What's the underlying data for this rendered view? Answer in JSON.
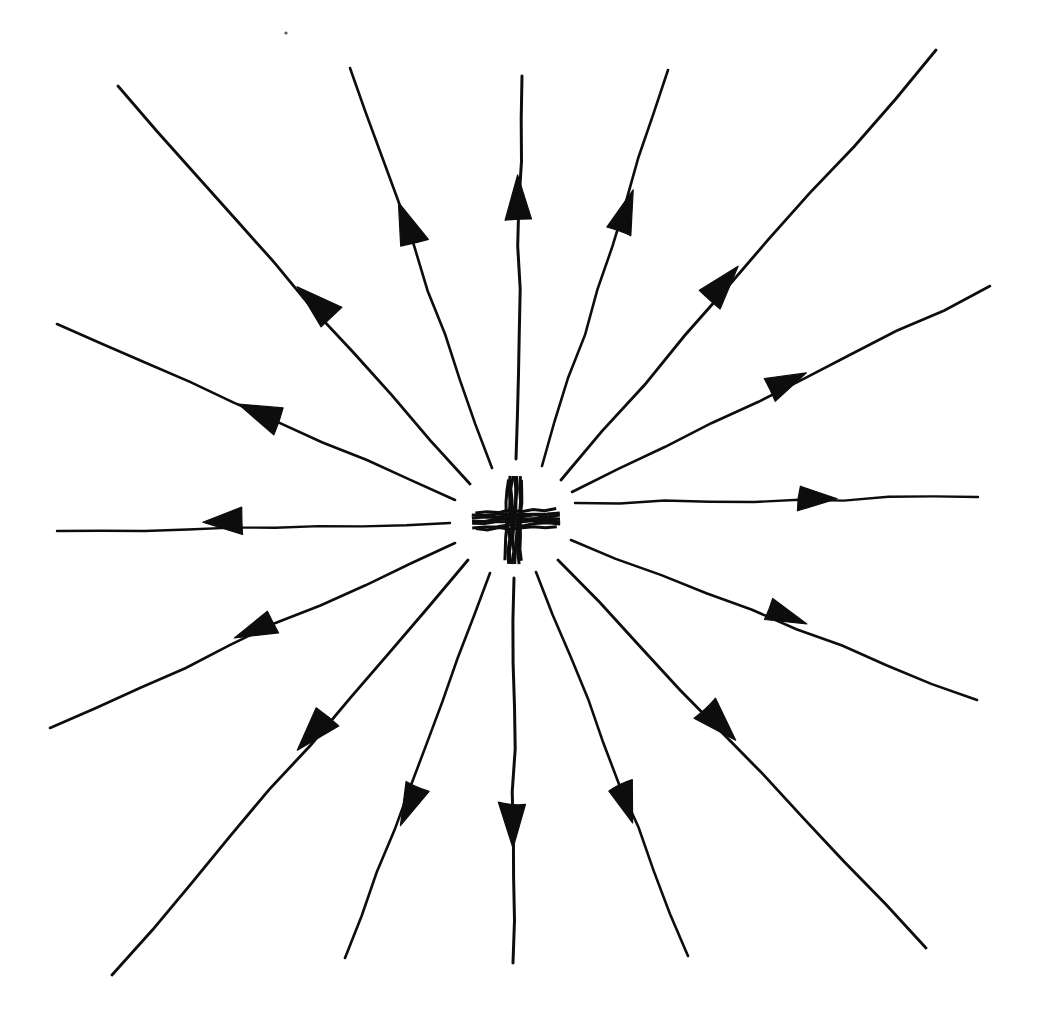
{
  "figure": {
    "kind": "hand-drawn-diagram",
    "background_color": "#ffffff",
    "ink_color": "#0d0d0d",
    "width": 1041,
    "height": 1026,
    "center": {
      "x": 513,
      "y": 520
    },
    "inner_gap_radius": 62,
    "charge": {
      "symbol": "+",
      "sign": "positive",
      "horizontal_bar": {
        "x1": 472,
        "y1": 521,
        "x2": 560,
        "y2": 518,
        "thickness": 17
      },
      "vertical_bar": {
        "x1": 515,
        "y1": 476,
        "x2": 513,
        "y2": 564,
        "thickness": 15
      }
    },
    "speck": {
      "x": 286,
      "y": 33,
      "r": 1.6
    },
    "ray_count": 16,
    "arrow_direction": "outward",
    "rays": [
      {
        "name": "ray-n",
        "angle_deg": -91,
        "start": {
          "x": 516,
          "y": 459
        },
        "end": {
          "x": 522,
          "y": 76
        },
        "arrow_at": {
          "x": 518,
          "y": 196
        },
        "arrow_angle_deg": -91,
        "stroke": 3.0,
        "arrow_size": 44
      },
      {
        "name": "ray-nne",
        "angle_deg": -66,
        "start": {
          "x": 542,
          "y": 466
        },
        "end": {
          "x": 668,
          "y": 70
        },
        "arrow_at": {
          "x": 627,
          "y": 209
        },
        "arrow_angle_deg": -72,
        "stroke": 2.6,
        "arrow_size": 42
      },
      {
        "name": "ray-ne",
        "angle_deg": -43,
        "start": {
          "x": 561,
          "y": 480
        },
        "end": {
          "x": 936,
          "y": 50
        },
        "arrow_at": {
          "x": 724,
          "y": 282
        },
        "arrow_angle_deg": -48,
        "stroke": 2.8,
        "arrow_size": 44
      },
      {
        "name": "ray-ene",
        "angle_deg": -24,
        "start": {
          "x": 572,
          "y": 492
        },
        "end": {
          "x": 990,
          "y": 286
        },
        "arrow_at": {
          "x": 789,
          "y": 381
        },
        "arrow_angle_deg": -25,
        "stroke": 2.6,
        "arrow_size": 40
      },
      {
        "name": "ray-e",
        "angle_deg": -2,
        "start": {
          "x": 575,
          "y": 503
        },
        "end": {
          "x": 978,
          "y": 497
        },
        "arrow_at": {
          "x": 819,
          "y": 499
        },
        "arrow_angle_deg": -1,
        "stroke": 2.4,
        "arrow_size": 38
      },
      {
        "name": "ray-ese",
        "angle_deg": 20,
        "start": {
          "x": 571,
          "y": 540
        },
        "end": {
          "x": 977,
          "y": 700
        },
        "arrow_at": {
          "x": 789,
          "y": 617
        },
        "arrow_angle_deg": 21,
        "stroke": 2.6,
        "arrow_size": 40
      },
      {
        "name": "ray-se",
        "angle_deg": 44,
        "start": {
          "x": 558,
          "y": 560
        },
        "end": {
          "x": 926,
          "y": 948
        },
        "arrow_at": {
          "x": 721,
          "y": 725
        },
        "arrow_angle_deg": 46,
        "stroke": 2.8,
        "arrow_size": 44
      },
      {
        "name": "ray-sse",
        "angle_deg": 70,
        "start": {
          "x": 536,
          "y": 572
        },
        "end": {
          "x": 688,
          "y": 956
        },
        "arrow_at": {
          "x": 626,
          "y": 805
        },
        "arrow_angle_deg": 70,
        "stroke": 2.6,
        "arrow_size": 40
      },
      {
        "name": "ray-s",
        "angle_deg": 90,
        "start": {
          "x": 514,
          "y": 578
        },
        "end": {
          "x": 513,
          "y": 963
        },
        "arrow_at": {
          "x": 513,
          "y": 827
        },
        "arrow_angle_deg": 90,
        "stroke": 3.0,
        "arrow_size": 44
      },
      {
        "name": "ray-ssw",
        "angle_deg": 112,
        "start": {
          "x": 490,
          "y": 573
        },
        "end": {
          "x": 345,
          "y": 958
        },
        "arrow_at": {
          "x": 408,
          "y": 807
        },
        "arrow_angle_deg": 112,
        "stroke": 2.6,
        "arrow_size": 42
      },
      {
        "name": "ray-sw",
        "angle_deg": 136,
        "start": {
          "x": 468,
          "y": 560
        },
        "end": {
          "x": 112,
          "y": 975
        },
        "arrow_at": {
          "x": 312,
          "y": 735
        },
        "arrow_angle_deg": 134,
        "stroke": 2.8,
        "arrow_size": 44
      },
      {
        "name": "ray-wsw",
        "angle_deg": 159,
        "start": {
          "x": 455,
          "y": 543
        },
        "end": {
          "x": 50,
          "y": 728
        },
        "arrow_at": {
          "x": 253,
          "y": 630
        },
        "arrow_angle_deg": 157,
        "stroke": 2.6,
        "arrow_size": 42
      },
      {
        "name": "ray-w",
        "angle_deg": 179,
        "start": {
          "x": 450,
          "y": 523
        },
        "end": {
          "x": 57,
          "y": 531
        },
        "arrow_at": {
          "x": 222,
          "y": 522
        },
        "arrow_angle_deg": 179,
        "stroke": 2.4,
        "arrow_size": 40
      },
      {
        "name": "ray-wnw",
        "angle_deg": -157,
        "start": {
          "x": 455,
          "y": 500
        },
        "end": {
          "x": 57,
          "y": 324
        },
        "arrow_at": {
          "x": 258,
          "y": 412
        },
        "arrow_angle_deg": -158,
        "stroke": 2.6,
        "arrow_size": 44
      },
      {
        "name": "ray-nw",
        "angle_deg": -137,
        "start": {
          "x": 470,
          "y": 484
        },
        "end": {
          "x": 118,
          "y": 86
        },
        "arrow_at": {
          "x": 313,
          "y": 302
        },
        "arrow_angle_deg": -136,
        "stroke": 2.8,
        "arrow_size": 46
      },
      {
        "name": "ray-nnw",
        "angle_deg": -113,
        "start": {
          "x": 492,
          "y": 468
        },
        "end": {
          "x": 350,
          "y": 68
        },
        "arrow_at": {
          "x": 406,
          "y": 222
        },
        "arrow_angle_deg": -111,
        "stroke": 2.6,
        "arrow_size": 44
      }
    ]
  }
}
